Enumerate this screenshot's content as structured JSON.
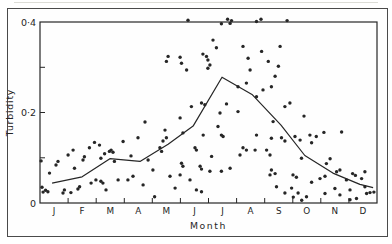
{
  "colors": {
    "ink": "#262626",
    "border": "#4a4a4a",
    "background": "#ffffff",
    "scan_edge": "#dcdcd6"
  },
  "chart_data": {
    "type": "scatter",
    "title": "",
    "ylabel": "Turbidity",
    "xlabel": "Month",
    "ylim": [
      0,
      0.4
    ],
    "xlim": [
      0,
      12
    ],
    "grid": false,
    "legend": false,
    "month_labels": [
      "J",
      "F",
      "M",
      "A",
      "M",
      "J",
      "J",
      "A",
      "S",
      "O",
      "N",
      "D"
    ],
    "y_ticks": [
      0.1,
      0.2,
      0.3
    ],
    "y_axis_labels": [
      {
        "value": 0,
        "label": "0"
      },
      {
        "value": 0.2,
        "label": "0·2"
      },
      {
        "value": 0.4,
        "label": "0·4"
      }
    ],
    "series": [
      {
        "name": "turbidity observations",
        "type": "scatter",
        "points": [
          [
            0.04,
            0.093
          ],
          [
            0.07,
            0.035
          ],
          [
            0.11,
            0.024
          ],
          [
            0.2,
            0.028
          ],
          [
            0.28,
            0.025
          ],
          [
            0.34,
            0.066
          ],
          [
            0.57,
            0.084
          ],
          [
            0.64,
            0.092
          ],
          [
            0.82,
            0.022
          ],
          [
            0.87,
            0.029
          ],
          [
            1.0,
            0.106
          ],
          [
            1.1,
            0.023
          ],
          [
            1.18,
            0.117
          ],
          [
            1.23,
            0.077
          ],
          [
            1.35,
            0.031
          ],
          [
            1.41,
            0.036
          ],
          [
            1.53,
            0.095
          ],
          [
            1.58,
            0.102
          ],
          [
            1.76,
            0.122
          ],
          [
            1.82,
            0.044
          ],
          [
            1.94,
            0.134
          ],
          [
            1.99,
            0.051
          ],
          [
            2.12,
            0.128
          ],
          [
            2.17,
            0.048
          ],
          [
            2.17,
            0.099
          ],
          [
            2.24,
            0.044
          ],
          [
            2.3,
            0.109
          ],
          [
            2.35,
            0.029
          ],
          [
            2.47,
            0.114
          ],
          [
            2.53,
            0.117
          ],
          [
            2.6,
            0.112
          ],
          [
            2.65,
            0.092
          ],
          [
            2.78,
            0.051
          ],
          [
            2.96,
            0.136
          ],
          [
            3.13,
            0.051
          ],
          [
            3.24,
            0.104
          ],
          [
            3.31,
            0.059
          ],
          [
            3.49,
            0.144
          ],
          [
            3.67,
            0.04
          ],
          [
            3.74,
            0.179
          ],
          [
            3.85,
            0.095
          ],
          [
            4.02,
            0.073
          ],
          [
            4.08,
            0.014
          ],
          [
            4.27,
            0.122
          ],
          [
            4.33,
            0.114
          ],
          [
            4.38,
            0.137
          ],
          [
            4.45,
            0.161
          ],
          [
            4.5,
            0.144
          ],
          [
            4.5,
            0.313
          ],
          [
            4.56,
            0.324
          ],
          [
            4.63,
            0.059
          ],
          [
            4.81,
            0.033
          ],
          [
            4.99,
            0.322
          ],
          [
            4.99,
            0.188
          ],
          [
            4.99,
            0.062
          ],
          [
            5.04,
            0.309
          ],
          [
            5.04,
            0.088
          ],
          [
            5.09,
            0.155
          ],
          [
            5.09,
            0.081
          ],
          [
            5.22,
            0.294
          ],
          [
            5.27,
            0.404
          ],
          [
            5.34,
            0.051
          ],
          [
            5.39,
            0.213
          ],
          [
            5.52,
            0.122
          ],
          [
            5.57,
            0.117
          ],
          [
            5.57,
            0.029
          ],
          [
            5.7,
            0.081
          ],
          [
            5.75,
            0.221
          ],
          [
            5.75,
            0.075
          ],
          [
            5.75,
            0.025
          ],
          [
            5.8,
            0.329
          ],
          [
            5.81,
            0.15
          ],
          [
            5.87,
            0.217
          ],
          [
            5.93,
            0.324
          ],
          [
            5.98,
            0.316
          ],
          [
            5.98,
            0.298
          ],
          [
            6.05,
            0.305
          ],
          [
            6.05,
            0.07
          ],
          [
            6.11,
            0.103
          ],
          [
            6.16,
            0.36
          ],
          [
            6.28,
            0.343
          ],
          [
            6.34,
            0.169
          ],
          [
            6.41,
            0.199
          ],
          [
            6.46,
            0.15
          ],
          [
            6.46,
            0.07
          ],
          [
            6.46,
            0.396
          ],
          [
            6.52,
            0.147
          ],
          [
            6.64,
            0.219
          ],
          [
            6.68,
            0.406
          ],
          [
            6.77,
            0.397
          ],
          [
            6.82,
            0.403
          ],
          [
            6.77,
            0.077
          ],
          [
            7.05,
            0.202
          ],
          [
            7.05,
            0.257
          ],
          [
            7.12,
            0.106
          ],
          [
            7.23,
            0.346
          ],
          [
            7.23,
            0.122
          ],
          [
            7.35,
            0.265
          ],
          [
            7.35,
            0.117
          ],
          [
            7.41,
            0.32
          ],
          [
            7.48,
            0.294
          ],
          [
            7.66,
            0.117
          ],
          [
            7.71,
            0.401
          ],
          [
            7.71,
            0.235
          ],
          [
            7.71,
            0.15
          ],
          [
            7.94,
            0.25
          ],
          [
            7.87,
            0.406
          ],
          [
            7.89,
            0.335
          ],
          [
            8.13,
            0.313
          ],
          [
            8.07,
            0.117
          ],
          [
            8.19,
            0.106
          ],
          [
            8.19,
            0.062
          ],
          [
            8.24,
            0.257
          ],
          [
            8.24,
            0.143
          ],
          [
            8.24,
            0.073
          ],
          [
            8.3,
            0.18
          ],
          [
            8.37,
            0.28
          ],
          [
            8.37,
            0.065
          ],
          [
            8.42,
            0.036
          ],
          [
            8.49,
            0.302
          ],
          [
            8.55,
            0.346
          ],
          [
            8.6,
            0.144
          ],
          [
            8.72,
            0.213
          ],
          [
            8.72,
            0.137
          ],
          [
            8.72,
            0.022
          ],
          [
            8.8,
            0.403
          ],
          [
            8.9,
            0.221
          ],
          [
            8.96,
            0.033
          ],
          [
            9.01,
            0.062
          ],
          [
            9.02,
            0.013
          ],
          [
            9.08,
            0.147
          ],
          [
            9.13,
            0.057
          ],
          [
            9.19,
            0.022
          ],
          [
            9.26,
            0.139
          ],
          [
            9.31,
            0.099
          ],
          [
            9.32,
            0.006
          ],
          [
            9.4,
            0.192
          ],
          [
            9.49,
            0.014
          ],
          [
            9.61,
            0.15
          ],
          [
            9.67,
            0.046
          ],
          [
            9.67,
            0.133
          ],
          [
            9.84,
            0.147
          ],
          [
            9.97,
            0.054
          ],
          [
            10.11,
            0.156
          ],
          [
            10.15,
            0.059
          ],
          [
            10.15,
            0.021
          ],
          [
            10.2,
            0.087
          ],
          [
            10.33,
            0.098
          ],
          [
            10.5,
            0.032
          ],
          [
            10.56,
            0.069
          ],
          [
            10.68,
            0.073
          ],
          [
            10.68,
            0.018
          ],
          [
            10.74,
            0.157
          ],
          [
            10.91,
            0.051
          ],
          [
            11.04,
            0.029
          ],
          [
            11.04,
            0.007
          ],
          [
            11.13,
            0.065
          ],
          [
            11.23,
            0.061
          ],
          [
            11.27,
            0.01
          ],
          [
            11.45,
            0.054
          ],
          [
            11.57,
            0.036
          ],
          [
            11.57,
            0.069
          ],
          [
            11.63,
            0.021
          ],
          [
            11.75,
            0.023
          ],
          [
            11.89,
            0.024
          ]
        ]
      },
      {
        "name": "monthly mean line",
        "type": "line",
        "points": [
          [
            0.43,
            0.044
          ],
          [
            1.5,
            0.058
          ],
          [
            2.49,
            0.098
          ],
          [
            3.56,
            0.092
          ],
          [
            4.56,
            0.13
          ],
          [
            5.45,
            0.17
          ],
          [
            6.48,
            0.278
          ],
          [
            7.55,
            0.24
          ],
          [
            8.58,
            0.172
          ],
          [
            9.43,
            0.105
          ],
          [
            10.43,
            0.066
          ],
          [
            11.39,
            0.041
          ],
          [
            11.86,
            0.034
          ]
        ]
      }
    ]
  }
}
